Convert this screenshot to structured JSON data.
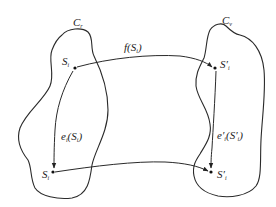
{
  "diagram": {
    "regions": [
      {
        "id": "Cr",
        "label": "C",
        "subscript": "r"
      },
      {
        "id": "Cv",
        "label": "C",
        "subscript": "v"
      }
    ],
    "nodes": [
      {
        "id": "Si_top",
        "label": "S",
        "subscript": "i",
        "prime": "",
        "x": 75,
        "y": 68
      },
      {
        "id": "Si_bottom",
        "label": "S",
        "subscript": "i",
        "prime": "",
        "x": 53,
        "y": 172
      },
      {
        "id": "Spi_top",
        "label": "S",
        "subscript": "i",
        "prime": "′",
        "x": 215,
        "y": 68
      },
      {
        "id": "Spi_bottom",
        "label": "S",
        "subscript": "i",
        "prime": "′",
        "x": 211,
        "y": 172
      }
    ],
    "edges": [
      {
        "from": "Si_top",
        "to": "Spi_top",
        "label": "f(S",
        "label_sub": "i",
        "label_end": ")"
      },
      {
        "from": "Si_top",
        "to": "Si_bottom",
        "label": "e",
        "label_sub": "i",
        "label_mid": "(S",
        "label_sub2": "i",
        "label_end": ")"
      },
      {
        "from": "Spi_top",
        "to": "Spi_bottom",
        "label": "e′",
        "label_sub": "i",
        "label_mid": "(S′",
        "label_sub2": "i",
        "label_end": ")"
      },
      {
        "from": "Si_bottom",
        "to": "Spi_bottom",
        "label": ""
      }
    ],
    "labels": {
      "cr_main": "C",
      "cr_sub": "r",
      "cv_main": "C",
      "cv_sub": "v",
      "si_top_main": "S",
      "si_top_sub": "i",
      "si_bot_main": "S",
      "si_bot_sub": "i",
      "spi_top_main": "S′",
      "spi_top_sub": "i",
      "spi_bot_main": "S′",
      "spi_bot_sub": "i",
      "f_label_a": "f(S",
      "f_label_sub": "i",
      "f_label_b": ")",
      "e_label_a": "e",
      "e_label_sub": "i",
      "e_label_b": "(S",
      "e_label_sub2": "i",
      "e_label_c": ")",
      "ep_label_a": "e′",
      "ep_label_sub": "i",
      "ep_label_b": "(S′",
      "ep_label_sub2": "i",
      "ep_label_c": ")"
    }
  }
}
